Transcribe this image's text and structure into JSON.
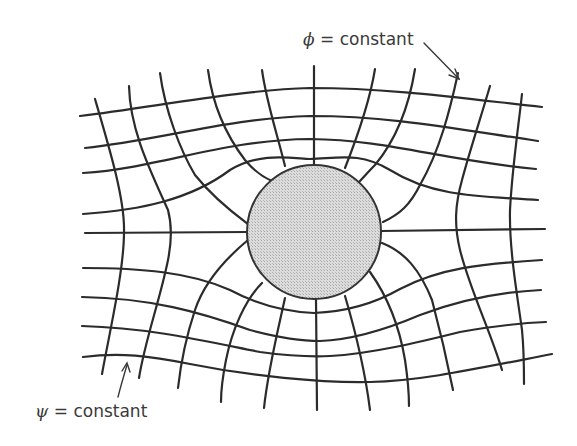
{
  "labels": {
    "phi": {
      "symbol": "ϕ",
      "text": " = constant"
    },
    "psi": {
      "symbol": "ψ",
      "text": " = constant"
    }
  },
  "diagram": {
    "cylinder": {
      "cx": 314,
      "cy": 232,
      "r": 67,
      "fill": "#d4d4d4",
      "stroke": "#333333"
    },
    "line_color": "#2b2b2b"
  }
}
